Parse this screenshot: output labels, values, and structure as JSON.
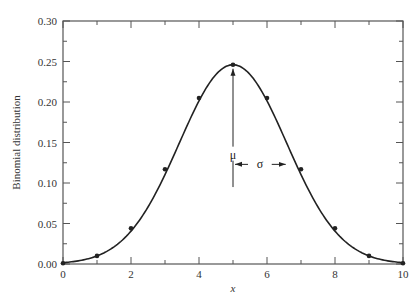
{
  "chart_data": {
    "type": "line",
    "title": "",
    "xlabel": "x",
    "ylabel": "Binomial distribution",
    "xlim": [
      0,
      10
    ],
    "ylim": [
      0,
      0.3
    ],
    "grid": false,
    "legend": null,
    "x_ticks_major": [
      0,
      2,
      4,
      6,
      8,
      10
    ],
    "x_tick_labels": [
      "0",
      "2",
      "4",
      "6",
      "8",
      "10"
    ],
    "x_ticks_minor": [
      1,
      3,
      5,
      7,
      9
    ],
    "y_ticks_major": [
      0.0,
      0.05,
      0.1,
      0.15,
      0.2,
      0.25,
      0.3
    ],
    "y_tick_labels": [
      "0.00",
      "0.05",
      "0.10",
      "0.15",
      "0.20",
      "0.25",
      "0.30"
    ],
    "y_ticks_minor": [
      0.025,
      0.075,
      0.125,
      0.175,
      0.225,
      0.275
    ],
    "series": [
      {
        "name": "Binomial points (n=10, p=0.5)",
        "style": "markers",
        "x": [
          0,
          1,
          2,
          3,
          4,
          5,
          6,
          7,
          8,
          9,
          10
        ],
        "values": [
          0.001,
          0.01,
          0.044,
          0.117,
          0.205,
          0.246,
          0.205,
          0.117,
          0.044,
          0.01,
          0.001
        ]
      },
      {
        "name": "Gaussian approximation curve",
        "style": "smooth-line",
        "mean": 5,
        "sigma": 1.58
      }
    ],
    "annotations": [
      {
        "text": "μ",
        "x": 5,
        "y": 0.135,
        "desc": "vertical arrow from mean marker up to peak"
      },
      {
        "text": "σ",
        "x": 6.0,
        "y": 0.123,
        "desc": "double arrow spanning one standard deviation right of mean"
      }
    ]
  }
}
